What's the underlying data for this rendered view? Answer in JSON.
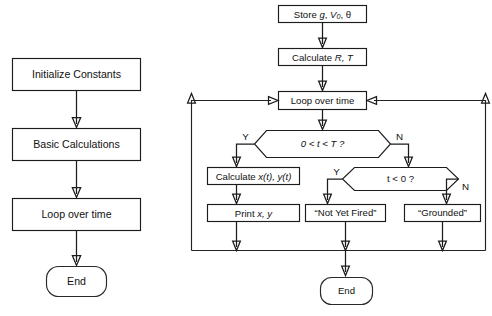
{
  "diagram": {
    "background_color": "#ffffff",
    "line_color": "#1c1c1c",
    "fill_color": "#ffffff"
  },
  "left_flowchart": {
    "name": "overview-flowchart",
    "nodes": [
      {
        "id": "initialize-constants",
        "label": "Initialize Constants",
        "shape": "rectangle"
      },
      {
        "id": "basic-calculations",
        "label": "Basic Calculations",
        "shape": "rectangle"
      },
      {
        "id": "loop-over-time",
        "label": "Loop over time",
        "shape": "rectangle"
      },
      {
        "id": "end",
        "label": "End",
        "shape": "rounded-rectangle"
      }
    ]
  },
  "right_flowchart": {
    "name": "detailed-flowchart",
    "nodes": [
      {
        "id": "store-constants",
        "label_prefix": "Store ",
        "label_var1": "g",
        "label_sep1": ", ",
        "label_var2": "V",
        "label_sub": "0",
        "label_sep2": ", ",
        "label_theta": "θ",
        "shape": "rectangle"
      },
      {
        "id": "calculate-r-t",
        "label_prefix": "Calculate ",
        "label_vars": "R, T",
        "shape": "rectangle"
      },
      {
        "id": "loop-over-time",
        "label": "Loop over time",
        "shape": "rectangle"
      },
      {
        "id": "decision-in-range",
        "label": "0 < t < T ?",
        "shape": "hexagon"
      },
      {
        "id": "calculate-xy",
        "label_prefix": "Calculate ",
        "label_vars": "x(t), y(t)",
        "shape": "rectangle"
      },
      {
        "id": "decision-t-negative",
        "label": "t < 0 ?",
        "shape": "hexagon"
      },
      {
        "id": "print-xy",
        "label_prefix": "Print ",
        "label_vars": "x, y",
        "shape": "rectangle"
      },
      {
        "id": "not-yet-fired",
        "label": "“Not Yet Fired”",
        "shape": "rectangle"
      },
      {
        "id": "grounded",
        "label": "“Grounded”",
        "shape": "rectangle"
      },
      {
        "id": "end",
        "label": "End",
        "shape": "rounded-rectangle"
      }
    ],
    "branch_labels": {
      "in_range_yes": "Y",
      "in_range_no": "N",
      "t_negative_yes": "Y",
      "t_negative_no": "N"
    }
  }
}
